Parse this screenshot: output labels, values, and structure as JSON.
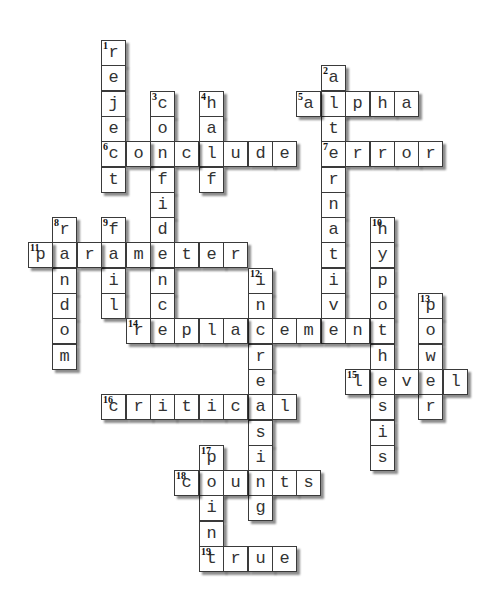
{
  "puzzle": {
    "grid": {
      "origin_x": 28,
      "origin_y": 40,
      "col_pitch": 24.4,
      "row_pitch": 25.3
    },
    "words": [
      {
        "number": 1,
        "answer": "reject",
        "direction": "down",
        "row": 0,
        "col": 3
      },
      {
        "number": 2,
        "answer": "alternative",
        "direction": "down",
        "row": 1,
        "col": 12
      },
      {
        "number": 3,
        "answer": "confidence",
        "direction": "down",
        "row": 2,
        "col": 5
      },
      {
        "number": 4,
        "answer": "half",
        "direction": "down",
        "row": 2,
        "col": 7
      },
      {
        "number": 5,
        "answer": "alpha",
        "direction": "across",
        "row": 2,
        "col": 11
      },
      {
        "number": 6,
        "answer": "conclude",
        "direction": "across",
        "row": 4,
        "col": 3
      },
      {
        "number": 7,
        "answer": "error",
        "direction": "across",
        "row": 4,
        "col": 12
      },
      {
        "number": 8,
        "answer": "random",
        "direction": "down",
        "row": 7,
        "col": 1
      },
      {
        "number": 9,
        "answer": "fail",
        "direction": "down",
        "row": 7,
        "col": 3
      },
      {
        "number": 10,
        "answer": "hypothesis",
        "direction": "down",
        "row": 7,
        "col": 14
      },
      {
        "number": 11,
        "answer": "parameter",
        "direction": "across",
        "row": 8,
        "col": 0
      },
      {
        "number": 12,
        "answer": "increasing",
        "direction": "down",
        "row": 9,
        "col": 9
      },
      {
        "number": 13,
        "answer": "power",
        "direction": "down",
        "row": 10,
        "col": 16
      },
      {
        "number": 14,
        "answer": "replacement",
        "direction": "across",
        "row": 11,
        "col": 4
      },
      {
        "number": 15,
        "answer": "level",
        "direction": "across",
        "row": 13,
        "col": 13
      },
      {
        "number": 16,
        "answer": "critical",
        "direction": "across",
        "row": 14,
        "col": 3
      },
      {
        "number": 17,
        "answer": "point",
        "direction": "down",
        "row": 16,
        "col": 7
      },
      {
        "number": 18,
        "answer": "counts",
        "direction": "across",
        "row": 17,
        "col": 6
      },
      {
        "number": 19,
        "answer": "true",
        "direction": "across",
        "row": 20,
        "col": 7
      }
    ]
  },
  "colors": {
    "cell_background": "#ffffff",
    "cell_border": "#3a3a3a",
    "letter": "#333333",
    "number": "#111111",
    "page_background": "#ffffff"
  }
}
